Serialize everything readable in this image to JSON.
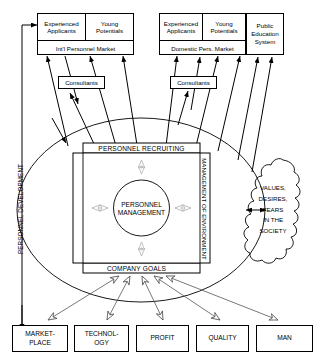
{
  "diagram": {
    "colors": {
      "stroke": "#000000",
      "fill": "#ffffff",
      "soft_arrow": "#b8b8b8",
      "hollow_arrow": "#555555"
    }
  },
  "intl_market": {
    "experienced": "Experienced\nApplicants",
    "experienced_l1": "Experienced",
    "experienced_l2": "Applicants",
    "young_l1": "Young",
    "young_l2": "Potentials",
    "market_label": "Int'l Personnel Market"
  },
  "domestic_market": {
    "experienced_l1": "Experienced",
    "experienced_l2": "Applicants",
    "young_l1": "Young",
    "young_l2": "Potentials",
    "market_label": "Domestic Pers. Market"
  },
  "public_education": {
    "l1": "Public",
    "l2": "Education",
    "l3": "System"
  },
  "consultants": {
    "left_label": "Consultants",
    "right_label": "Consultants"
  },
  "core": {
    "recruiting": "PERSONNEL RECRUITING",
    "development": "PERSONNEL DEVELOPMENT",
    "environment": "MANAGEMENT OF ENVIRONMENT",
    "company_goals": "COMPANY GOALS",
    "center_l1": "PERSONNEL",
    "center_l2": "MANAGEMENT"
  },
  "society_cloud": {
    "l1": "VALUES,",
    "l2": "DESIRES,",
    "l3": "FEARS",
    "l4": "IN THE",
    "l5": "SOCIETY"
  },
  "goal_boxes": [
    {
      "l1": "MARKET-",
      "l2": "PLACE"
    },
    {
      "l1": "TECHNOL-",
      "l2": "OGY"
    },
    {
      "l1": "PROFIT",
      "l2": ""
    },
    {
      "l1": "QUALITY",
      "l2": ""
    },
    {
      "l1": "MAN",
      "l2": ""
    }
  ]
}
